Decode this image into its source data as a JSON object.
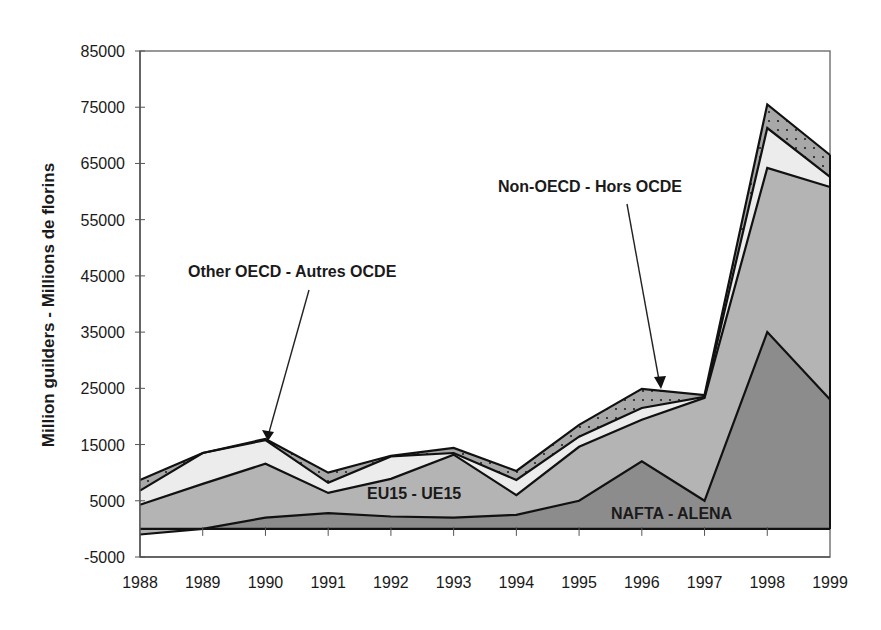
{
  "chart_data": {
    "type": "area",
    "stacked": true,
    "title": "",
    "xlabel": "",
    "ylabel": "Million guilders - Millions de florins",
    "categories": [
      "1988",
      "1989",
      "1990",
      "1991",
      "1992",
      "1993",
      "1994",
      "1995",
      "1996",
      "1997",
      "1998",
      "1999"
    ],
    "ylim": [
      -5000,
      85000
    ],
    "yticks": [
      85000,
      75000,
      65000,
      55000,
      45000,
      35000,
      25000,
      15000,
      5000,
      -5000
    ],
    "grid": false,
    "legend": "none (inline annotations)",
    "series": [
      {
        "name": "NAFTA - ALENA",
        "color": "#8c8c8c",
        "values": [
          -1000,
          0,
          2000,
          2800,
          2200,
          2000,
          2500,
          5000,
          12000,
          5000,
          35000,
          23000
        ]
      },
      {
        "name": "EU15 - UE15",
        "color": "#b4b4b4",
        "values": [
          5300,
          8000,
          9600,
          3600,
          6700,
          11200,
          3500,
          9600,
          7400,
          18300,
          29200,
          37800
        ]
      },
      {
        "name": "Other OECD - Autres OCDE",
        "color": "#ececec",
        "values": [
          2500,
          5500,
          4200,
          1800,
          4000,
          300,
          2700,
          1800,
          2100,
          200,
          7100,
          1800
        ]
      },
      {
        "name": "Non-OECD - Hors OCDE",
        "color": "#a6a6a6",
        "pattern": "dotted",
        "values": [
          1900,
          0,
          200,
          1800,
          100,
          900,
          1600,
          2100,
          3400,
          300,
          4200,
          3900
        ]
      }
    ],
    "cumulative_tops": {
      "NAFTA - ALENA": [
        -1000,
        0,
        2000,
        2800,
        2200,
        2000,
        2500,
        5000,
        12000,
        5000,
        35000,
        23000
      ],
      "EU15 - UE15": [
        4300,
        8000,
        11600,
        6400,
        8900,
        13200,
        6000,
        14600,
        19400,
        23300,
        64200,
        60800
      ],
      "Other OECD - Autres OCDE": [
        6800,
        13500,
        15800,
        8200,
        12900,
        13500,
        8700,
        16400,
        21500,
        23500,
        71300,
        62600
      ],
      "Non-OECD - Hors OCDE": [
        8700,
        13500,
        16000,
        10000,
        13000,
        14400,
        10300,
        18500,
        24900,
        23800,
        75500,
        66500
      ]
    },
    "annotations": [
      {
        "text": "Other OECD - Autres OCDE",
        "arrow_to_year": "1990"
      },
      {
        "text": "Non-OECD - Hors OCDE",
        "arrow_to_year": "1996"
      },
      {
        "text": "EU15 - UE15",
        "inside_area": true
      },
      {
        "text": "NAFTA - ALENA",
        "inside_area": true
      }
    ]
  },
  "labels": {
    "ylabel": "Million guilders - Millions de florins",
    "other_oecd": "Other OECD - Autres OCDE",
    "non_oecd": "Non-OECD - Hors OCDE",
    "eu15": "EU15 - UE15",
    "nafta": "NAFTA - ALENA"
  }
}
